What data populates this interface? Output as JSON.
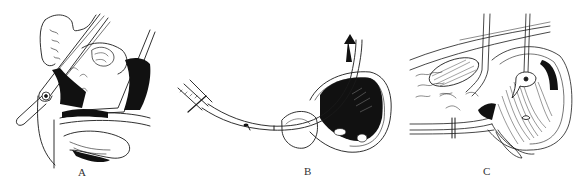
{
  "figure": {
    "panels": [
      {
        "id": "A",
        "label": "A"
      },
      {
        "id": "B",
        "label": "B"
      },
      {
        "id": "C",
        "label": "C"
      }
    ],
    "colors": {
      "ink": "#1a1a1a",
      "background": "#ffffff",
      "label": "#333333"
    }
  }
}
